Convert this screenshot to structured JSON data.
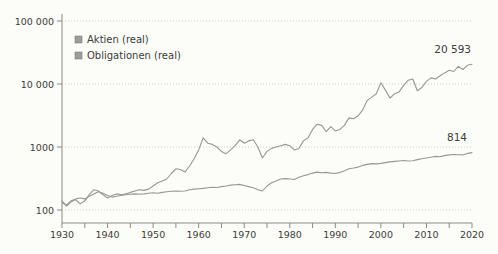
{
  "chart": {
    "colors": {
      "background": "#fcfcf9",
      "axis": "#8a8a8a",
      "grid": "#cfcfca",
      "text": "#3d3d3b",
      "line": "#979797",
      "legend_marker": "#9c9c9c",
      "legend_marker_border": "#7d7d7d"
    },
    "legend": [
      {
        "label": "Aktien (real)"
      },
      {
        "label": "Obligationen (real)"
      }
    ],
    "y_tick_labels": [
      "100",
      "1000",
      "10 000",
      "100 000"
    ]
  },
  "chart_data": {
    "type": "line",
    "title": "",
    "xlabel": "",
    "ylabel": "",
    "y_scale": "log",
    "xlim": [
      1930,
      2020
    ],
    "ylim": [
      62,
      100000
    ],
    "y_ticks": [
      100,
      1000,
      10000,
      100000
    ],
    "x_tick_years": [
      1930,
      1940,
      1950,
      1960,
      1970,
      1980,
      1990,
      2000,
      2010,
      2020
    ],
    "x_minor_tick_step": 5,
    "grid": "dotted-horizontal",
    "legend_position": "top-left-inside",
    "x": [
      1930,
      1931,
      1932,
      1933,
      1934,
      1935,
      1936,
      1937,
      1938,
      1939,
      1940,
      1941,
      1942,
      1943,
      1944,
      1945,
      1946,
      1947,
      1948,
      1949,
      1950,
      1951,
      1952,
      1953,
      1954,
      1955,
      1956,
      1957,
      1958,
      1959,
      1960,
      1961,
      1962,
      1963,
      1964,
      1965,
      1966,
      1967,
      1968,
      1969,
      1970,
      1971,
      1972,
      1973,
      1974,
      1975,
      1976,
      1977,
      1978,
      1979,
      1980,
      1981,
      1982,
      1983,
      1984,
      1985,
      1986,
      1987,
      1988,
      1989,
      1990,
      1991,
      1992,
      1993,
      1994,
      1995,
      1996,
      1997,
      1998,
      1999,
      2000,
      2001,
      2002,
      2003,
      2004,
      2005,
      2006,
      2007,
      2008,
      2009,
      2010,
      2011,
      2012,
      2013,
      2014,
      2015,
      2016,
      2017,
      2018,
      2019,
      2020
    ],
    "series": [
      {
        "id": "aktien",
        "name": "Aktien (real)",
        "end_label": "20 593",
        "end_value": 20593,
        "values": [
          140,
          115,
          135,
          145,
          125,
          140,
          175,
          210,
          200,
          175,
          155,
          170,
          180,
          175,
          180,
          190,
          200,
          210,
          205,
          215,
          240,
          270,
          290,
          310,
          380,
          450,
          440,
          400,
          500,
          650,
          900,
          1400,
          1150,
          1100,
          1000,
          850,
          780,
          900,
          1050,
          1300,
          1150,
          1250,
          1300,
          1000,
          670,
          850,
          950,
          1000,
          1050,
          1100,
          1050,
          900,
          950,
          1250,
          1400,
          1900,
          2300,
          2200,
          1750,
          2100,
          1800,
          1900,
          2200,
          2900,
          2800,
          3100,
          3900,
          5500,
          6200,
          7000,
          10500,
          8000,
          6000,
          7000,
          7500,
          9500,
          11500,
          12000,
          7800,
          8800,
          11000,
          12500,
          12000,
          13500,
          15000,
          16500,
          15800,
          19000,
          17000,
          19800,
          20593
        ]
      },
      {
        "id": "obligationen",
        "name": "Obligationen (real)",
        "end_label": "814",
        "end_value": 814,
        "values": [
          130,
          120,
          140,
          150,
          155,
          150,
          165,
          180,
          195,
          185,
          170,
          160,
          165,
          170,
          175,
          178,
          180,
          178,
          180,
          185,
          188,
          185,
          190,
          195,
          198,
          200,
          198,
          200,
          210,
          215,
          218,
          220,
          225,
          230,
          228,
          235,
          240,
          248,
          252,
          255,
          245,
          235,
          225,
          210,
          200,
          240,
          270,
          290,
          310,
          315,
          310,
          305,
          330,
          350,
          365,
          385,
          400,
          390,
          395,
          385,
          380,
          395,
          420,
          450,
          465,
          480,
          510,
          530,
          545,
          540,
          550,
          565,
          580,
          590,
          600,
          610,
          600,
          605,
          630,
          650,
          670,
          690,
          710,
          700,
          730,
          750,
          760,
          755,
          750,
          790,
          814
        ]
      }
    ]
  }
}
